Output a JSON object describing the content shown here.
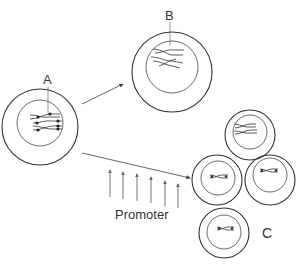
{
  "diagram": {
    "labels": {
      "a": "A",
      "b": "B",
      "c": "C",
      "promoter": "Promoter"
    },
    "cells": [
      {
        "id": "A",
        "cx": 40,
        "cy": 127,
        "outer_r": 38,
        "inner_r": 23
      },
      {
        "id": "B",
        "cx": 172,
        "cy": 72,
        "outer_r": 40,
        "inner_r": 26
      },
      {
        "id": "C-top",
        "cx": 250,
        "cy": 135,
        "outer_r": 25,
        "inner_r": 17
      },
      {
        "id": "C-left",
        "cx": 217,
        "cy": 180,
        "outer_r": 25,
        "inner_r": 17
      },
      {
        "id": "C-right",
        "cx": 270,
        "cy": 180,
        "outer_r": 25,
        "inner_r": 17
      },
      {
        "id": "C-bottom",
        "cx": 224,
        "cy": 230,
        "outer_r": 25,
        "inner_r": 17
      }
    ],
    "colors": {
      "stroke": "#333333",
      "promoter_arrows": "#777777",
      "background": "#ffffff"
    },
    "promoter_arrow_count": 6
  }
}
